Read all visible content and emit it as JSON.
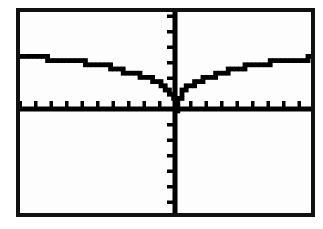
{
  "screen": {
    "device_label": "graphing-calculator-screen",
    "frame_color": "#111111",
    "background_color": "#fdfdfd",
    "plot_color": "#000000",
    "outer_background": "#ffffff"
  },
  "chart_data": {
    "type": "line",
    "title": "",
    "subtitle": "",
    "xlabel": "",
    "ylabel": "",
    "legend": [],
    "annotations": [],
    "grid": false,
    "legend_position": "none",
    "axis_style": "calculator-tick-axes",
    "symmetry": "even (mirror about y-axis)",
    "xlim": [
      -10.5,
      9.5
    ],
    "ylim": [
      -11.5,
      10.5
    ],
    "x_tick_count_left": 10,
    "x_tick_count_right": 10,
    "y_tick_count_above": 10,
    "y_tick_count_below": 11,
    "x_tick_spacing": 1,
    "y_tick_spacing": 1,
    "plateau_value": 3.5,
    "origin_value": 0,
    "series": [
      {
        "name": "y = |x|^(1/3) curve",
        "x": [
          -10.5,
          -10,
          -9.5,
          -9,
          -8.5,
          -8,
          -7.5,
          -7,
          -6.5,
          -6,
          -5.5,
          -5,
          -4.5,
          -4,
          -3.5,
          -3,
          -2.5,
          -2,
          -1.5,
          -1.2,
          -1,
          -0.8,
          -0.6,
          -0.45,
          -0.3,
          -0.18,
          -0.09,
          -0.03,
          0,
          0.03,
          0.09,
          0.18,
          0.3,
          0.45,
          0.6,
          0.8,
          1,
          1.2,
          1.5,
          2,
          2.5,
          3,
          3.5,
          4,
          4.5,
          5,
          5.5,
          6,
          6.5,
          7,
          7.5,
          8,
          8.5,
          9,
          9.5
        ],
        "y": [
          3.52,
          3.5,
          3.48,
          3.45,
          3.42,
          3.38,
          3.34,
          3.29,
          3.23,
          3.16,
          3.08,
          2.99,
          2.89,
          2.77,
          2.64,
          2.49,
          2.34,
          2.17,
          1.97,
          1.83,
          1.72,
          1.6,
          1.45,
          1.31,
          1.14,
          0.96,
          0.76,
          0.53,
          0,
          0.53,
          0.76,
          0.96,
          1.14,
          1.31,
          1.45,
          1.6,
          1.72,
          1.83,
          1.97,
          2.17,
          2.34,
          2.49,
          2.64,
          2.77,
          2.89,
          2.99,
          3.08,
          3.16,
          3.23,
          3.29,
          3.34,
          3.38,
          3.42,
          3.45,
          3.48
        ]
      }
    ]
  }
}
